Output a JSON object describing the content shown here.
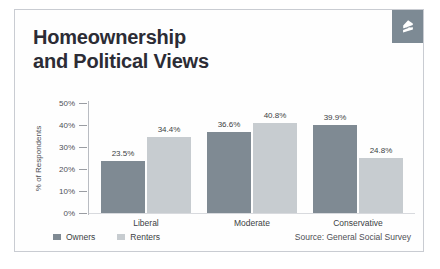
{
  "card": {
    "logo_name": "zillow-logo",
    "logo_color": "#7d8a94",
    "border_color": "#c9ccd2",
    "background": "#fefefe"
  },
  "title": {
    "line1": "Homeownership",
    "line2": "and Political Views",
    "color": "#2c2c35"
  },
  "legend": {
    "position": "bottom-left",
    "items": [
      {
        "label": "Owners",
        "color": "#7f8a93"
      },
      {
        "label": "Renters",
        "color": "#c7ccd0"
      }
    ]
  },
  "source": {
    "text": "Source: General Social Survey"
  },
  "axis": {
    "ylabel": "% of Respondents",
    "yticks": [
      "0%",
      "10%",
      "20%",
      "30%",
      "40%",
      "50%"
    ]
  },
  "chart_data": {
    "type": "bar",
    "title": "Homeownership and Political Views",
    "xlabel": "",
    "ylabel": "% of Respondents",
    "ylim": [
      0,
      50
    ],
    "ytick_values": [
      0,
      10,
      20,
      30,
      40,
      50
    ],
    "ytick_labels": [
      "0%",
      "10%",
      "20%",
      "30%",
      "40%",
      "50%"
    ],
    "grid": false,
    "legend_position": "bottom-left",
    "source": "Source: General Social Survey",
    "categories": [
      "Liberal",
      "Moderate",
      "Conservative"
    ],
    "series": [
      {
        "name": "Owners",
        "color": "#7f8a93",
        "values": [
          23.5,
          36.6,
          39.9
        ],
        "labels": [
          "23.5%",
          "36.6%",
          "39.9%"
        ]
      },
      {
        "name": "Renters",
        "color": "#c7ccd0",
        "values": [
          34.4,
          40.8,
          24.8
        ],
        "labels": [
          "34.4%",
          "40.8%",
          "24.8%"
        ]
      }
    ]
  }
}
